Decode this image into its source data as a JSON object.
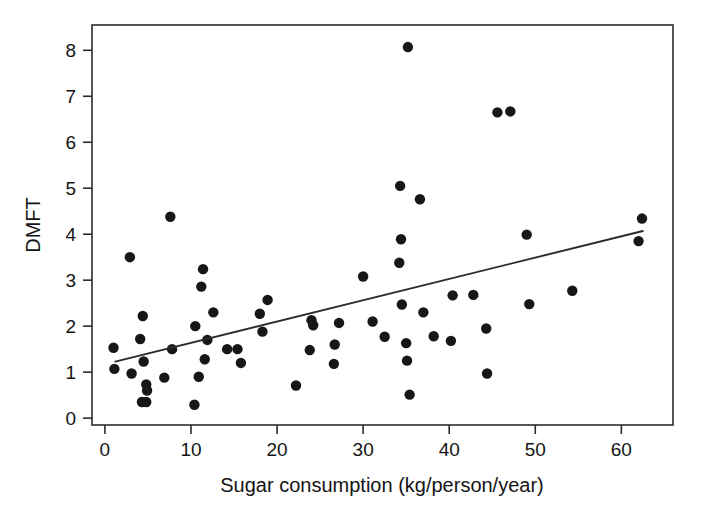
{
  "chart_data": {
    "type": "scatter",
    "title": "",
    "xlabel": "Sugar consumption (kg/person/year)",
    "ylabel": "DMFT",
    "xlim": [
      -1.5,
      66.0
    ],
    "ylim": [
      -0.15,
      8.55
    ],
    "grid": false,
    "legend": null,
    "x_ticks": [
      0,
      10,
      20,
      30,
      40,
      50,
      60
    ],
    "x_tick_labels": [
      "0",
      "10",
      "20",
      "30",
      "40",
      "50",
      "60"
    ],
    "y_ticks": [
      0,
      1,
      2,
      3,
      4,
      5,
      6,
      7,
      8
    ],
    "y_tick_labels": [
      "0",
      "1",
      "2",
      "3",
      "4",
      "5",
      "6",
      "7",
      "8"
    ],
    "marker": "filled-circle",
    "marker_color": "#171717",
    "marker_radius_px": 5.2,
    "points": [
      {
        "x": 1.0,
        "y": 1.53
      },
      {
        "x": 1.1,
        "y": 1.07
      },
      {
        "x": 2.9,
        "y": 3.5
      },
      {
        "x": 3.1,
        "y": 0.97
      },
      {
        "x": 4.1,
        "y": 1.72
      },
      {
        "x": 4.3,
        "y": 0.35
      },
      {
        "x": 4.8,
        "y": 0.35
      },
      {
        "x": 4.4,
        "y": 2.22
      },
      {
        "x": 4.5,
        "y": 1.23
      },
      {
        "x": 4.8,
        "y": 0.73
      },
      {
        "x": 4.9,
        "y": 0.6
      },
      {
        "x": 6.9,
        "y": 0.88
      },
      {
        "x": 7.6,
        "y": 4.38
      },
      {
        "x": 7.8,
        "y": 1.5
      },
      {
        "x": 10.4,
        "y": 0.29
      },
      {
        "x": 10.5,
        "y": 2.0
      },
      {
        "x": 10.9,
        "y": 0.9
      },
      {
        "x": 11.2,
        "y": 2.86
      },
      {
        "x": 11.4,
        "y": 3.24
      },
      {
        "x": 11.6,
        "y": 1.28
      },
      {
        "x": 11.9,
        "y": 1.7
      },
      {
        "x": 12.6,
        "y": 2.3
      },
      {
        "x": 14.2,
        "y": 1.5
      },
      {
        "x": 15.4,
        "y": 1.5
      },
      {
        "x": 15.8,
        "y": 1.2
      },
      {
        "x": 18.0,
        "y": 2.27
      },
      {
        "x": 18.3,
        "y": 1.88
      },
      {
        "x": 18.9,
        "y": 2.57
      },
      {
        "x": 22.2,
        "y": 0.71
      },
      {
        "x": 23.8,
        "y": 1.48
      },
      {
        "x": 24.0,
        "y": 2.13
      },
      {
        "x": 24.2,
        "y": 2.02
      },
      {
        "x": 26.6,
        "y": 1.18
      },
      {
        "x": 26.7,
        "y": 1.6
      },
      {
        "x": 27.2,
        "y": 2.07
      },
      {
        "x": 30.0,
        "y": 3.08
      },
      {
        "x": 31.1,
        "y": 2.1
      },
      {
        "x": 32.5,
        "y": 1.77
      },
      {
        "x": 34.2,
        "y": 3.38
      },
      {
        "x": 34.3,
        "y": 5.05
      },
      {
        "x": 34.4,
        "y": 3.89
      },
      {
        "x": 34.5,
        "y": 2.47
      },
      {
        "x": 35.0,
        "y": 1.63
      },
      {
        "x": 35.1,
        "y": 1.25
      },
      {
        "x": 35.2,
        "y": 8.07
      },
      {
        "x": 35.4,
        "y": 0.51
      },
      {
        "x": 36.6,
        "y": 4.76
      },
      {
        "x": 37.0,
        "y": 2.3
      },
      {
        "x": 38.2,
        "y": 1.78
      },
      {
        "x": 40.2,
        "y": 1.68
      },
      {
        "x": 40.4,
        "y": 2.67
      },
      {
        "x": 42.8,
        "y": 2.68
      },
      {
        "x": 44.3,
        "y": 1.95
      },
      {
        "x": 44.4,
        "y": 0.97
      },
      {
        "x": 45.6,
        "y": 6.65
      },
      {
        "x": 47.1,
        "y": 6.67
      },
      {
        "x": 49.0,
        "y": 3.99
      },
      {
        "x": 49.3,
        "y": 2.48
      },
      {
        "x": 54.3,
        "y": 2.77
      },
      {
        "x": 62.0,
        "y": 3.85
      },
      {
        "x": 62.4,
        "y": 4.34
      }
    ],
    "trend_line": {
      "type": "linear-regression",
      "x_start": 1.2,
      "y_start": 1.23,
      "x_end": 62.5,
      "y_end": 4.07
    }
  }
}
